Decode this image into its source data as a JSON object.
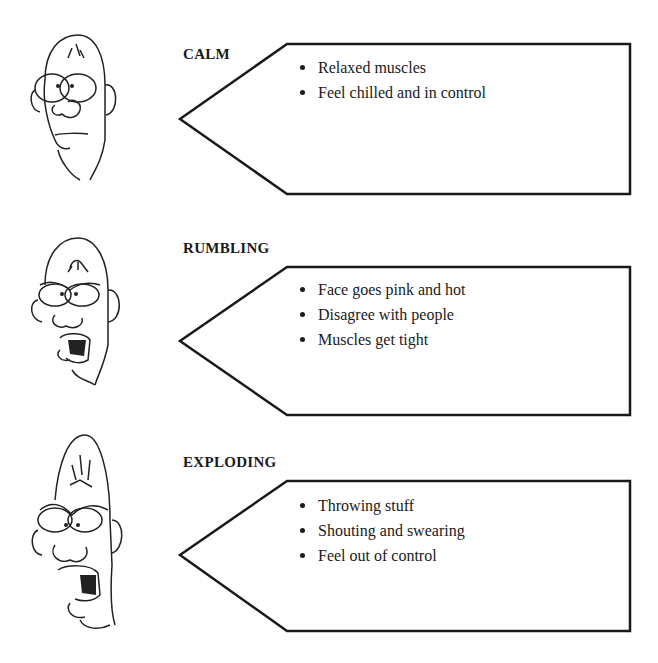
{
  "stages": [
    {
      "id": "calm",
      "label": "CALM",
      "face_icon": "calm-face-icon",
      "bullets": [
        "Relaxed muscles",
        "Feel chilled and in control"
      ]
    },
    {
      "id": "rumbling",
      "label": "RUMBLING",
      "face_icon": "rumbling-face-icon",
      "bullets": [
        "Face goes pink and hot",
        "Disagree with people",
        "Muscles get tight"
      ]
    },
    {
      "id": "exploding",
      "label": "EXPLODING",
      "face_icon": "exploding-face-icon",
      "bullets": [
        "Throwing stuff",
        "Shouting and swearing",
        "Feel out of control"
      ]
    }
  ]
}
